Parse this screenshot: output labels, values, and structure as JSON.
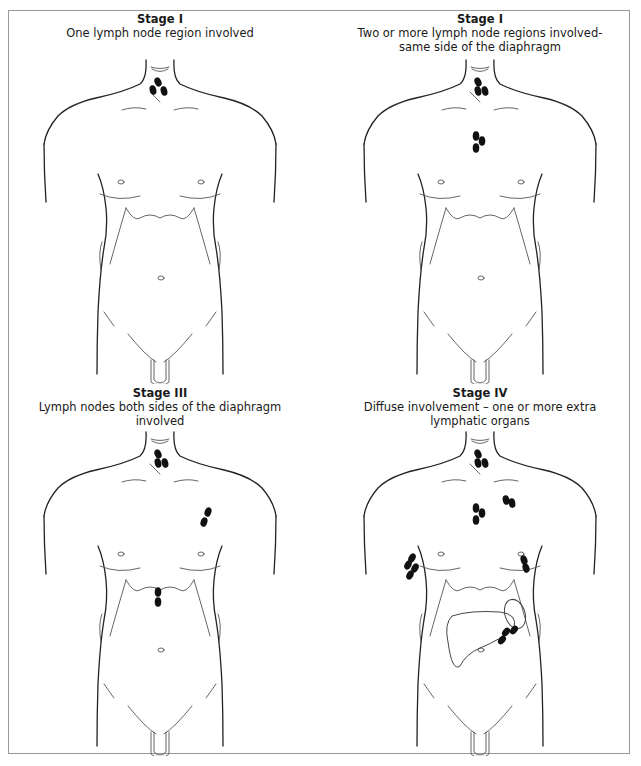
{
  "figure": {
    "panels": [
      {
        "id": "stage-1-a",
        "stage": "Stage I",
        "description": "One lymph node region involved",
        "nodes": [
          [
            50,
            72,
            -25
          ],
          [
            45,
            80,
            -15
          ],
          [
            56,
            81,
            -15
          ]
        ],
        "organs": []
      },
      {
        "id": "stage-1-b",
        "stage": "Stage I",
        "description": "Two or more lymph node regions involved-same side of the diaphragm",
        "nodes": [
          [
            50,
            72,
            -25
          ],
          [
            50,
            81,
            -15
          ],
          [
            57,
            81,
            -15
          ],
          [
            48,
            126,
            0
          ],
          [
            54,
            131,
            0
          ],
          [
            48,
            138,
            0
          ]
        ],
        "organs": []
      },
      {
        "id": "stage-3",
        "stage": "Stage III",
        "description": "Lymph nodes both sides of the diaphragm involved",
        "nodes": [
          [
            50,
            72,
            -25
          ],
          [
            50,
            81,
            -15
          ],
          [
            57,
            81,
            -15
          ],
          [
            100,
            130,
            20
          ],
          [
            96,
            140,
            20
          ],
          [
            50,
            210,
            0
          ],
          [
            50,
            220,
            0
          ]
        ],
        "organs": []
      },
      {
        "id": "stage-4",
        "stage": "Stage IV",
        "description": "Diffuse involvement – one or more extra lymphatic organs",
        "nodes": [
          [
            50,
            72,
            -25
          ],
          [
            50,
            81,
            -15
          ],
          [
            57,
            81,
            -15
          ],
          [
            48,
            126,
            0
          ],
          [
            54,
            131,
            0
          ],
          [
            48,
            138,
            0
          ],
          [
            78,
            118,
            -10
          ],
          [
            84,
            121,
            -10
          ],
          [
            -16,
            176,
            30
          ],
          [
            -20,
            183,
            30
          ],
          [
            -13,
            186,
            30
          ],
          [
            -18,
            193,
            30
          ],
          [
            96,
            178,
            -20
          ],
          [
            98,
            186,
            -20
          ],
          [
            78,
            250,
            40
          ],
          [
            86,
            248,
            40
          ],
          [
            74,
            258,
            40
          ]
        ],
        "organs": [
          "liver",
          "spleen"
        ]
      }
    ]
  }
}
